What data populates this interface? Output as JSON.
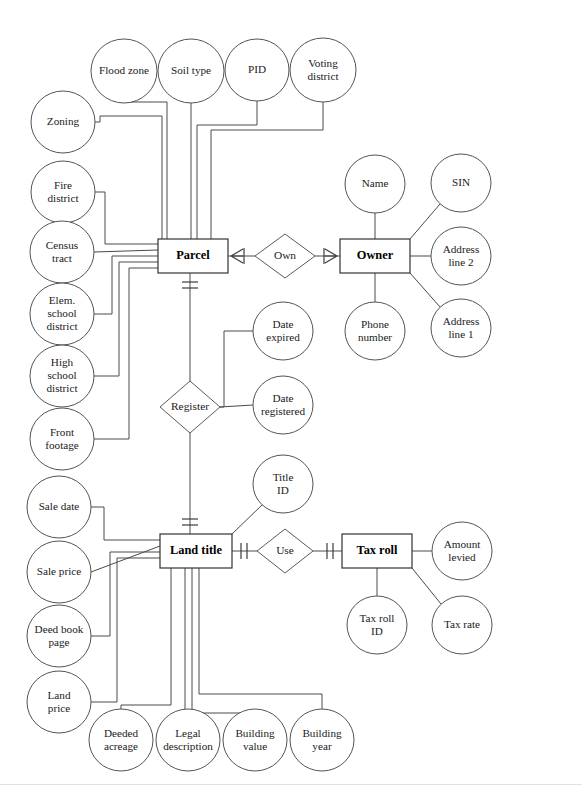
{
  "diagram": {
    "type": "entity-relationship-diagram",
    "notation": "crows-foot",
    "width": 582,
    "height": 803,
    "background_color": "#ffffff",
    "line_color": "#4a4a4a",
    "entities": [
      {
        "id": "parcel",
        "label": "Parcel",
        "x": 193,
        "y": 256,
        "w": 70,
        "h": 34
      },
      {
        "id": "owner",
        "label": "Owner",
        "x": 375,
        "y": 256,
        "w": 70,
        "h": 34
      },
      {
        "id": "land_title",
        "label": "Land title",
        "x": 196,
        "y": 551,
        "w": 72,
        "h": 34
      },
      {
        "id": "tax_roll",
        "label": "Tax roll",
        "x": 377,
        "y": 551,
        "w": 70,
        "h": 34
      }
    ],
    "relationships": [
      {
        "id": "own",
        "label": "Own",
        "x": 285,
        "y": 256,
        "rx": 30,
        "ry": 22,
        "from": "parcel",
        "to": "owner",
        "from_cardinality": "one-or-many",
        "to_cardinality": "one-or-many"
      },
      {
        "id": "register",
        "label": "Register",
        "x": 190,
        "y": 407,
        "rx": 30,
        "ry": 26,
        "from": "parcel",
        "to": "land_title",
        "from_cardinality": "one-and-only-one",
        "to_cardinality": "one-and-only-one"
      },
      {
        "id": "use",
        "label": "Use",
        "x": 285,
        "y": 551,
        "rx": 28,
        "ry": 22,
        "from": "land_title",
        "to": "tax_roll",
        "from_cardinality": "one-and-only-one",
        "to_cardinality": "one-and-only-one"
      }
    ],
    "attributes": [
      {
        "id": "flood_zone",
        "label": "Flood zone",
        "lines": [
          "Flood zone"
        ],
        "cx": 124,
        "cy": 71,
        "rx": 33,
        "ry": 32,
        "owner": "parcel"
      },
      {
        "id": "soil_type",
        "label": "Soil type",
        "lines": [
          "Soil type"
        ],
        "cx": 191,
        "cy": 71,
        "rx": 33,
        "ry": 32,
        "owner": "parcel"
      },
      {
        "id": "pid",
        "label": "PID",
        "lines": [
          "PID"
        ],
        "cx": 257,
        "cy": 70,
        "rx": 32,
        "ry": 31,
        "owner": "parcel"
      },
      {
        "id": "voting_district",
        "label": "Voting district",
        "lines": [
          "Voting",
          "district"
        ],
        "cx": 323,
        "cy": 70,
        "rx": 33,
        "ry": 32,
        "owner": "parcel"
      },
      {
        "id": "zoning",
        "label": "Zoning",
        "lines": [
          "Zoning"
        ],
        "cx": 63,
        "cy": 122,
        "rx": 32,
        "ry": 31,
        "owner": "parcel"
      },
      {
        "id": "fire_district",
        "label": "Fire district",
        "lines": [
          "Fire",
          "district"
        ],
        "cx": 63,
        "cy": 192,
        "rx": 32,
        "ry": 31,
        "owner": "parcel"
      },
      {
        "id": "census_tract",
        "label": "Census tract",
        "lines": [
          "Census",
          "tract"
        ],
        "cx": 62,
        "cy": 252,
        "rx": 32,
        "ry": 31,
        "owner": "parcel"
      },
      {
        "id": "elem_school",
        "label": "Elem. school district",
        "lines": [
          "Elem.",
          "school",
          "district"
        ],
        "cx": 62,
        "cy": 314,
        "rx": 32,
        "ry": 31,
        "owner": "parcel"
      },
      {
        "id": "high_school",
        "label": "High school district",
        "lines": [
          "High",
          "school",
          "district"
        ],
        "cx": 62,
        "cy": 376,
        "rx": 32,
        "ry": 31,
        "owner": "parcel"
      },
      {
        "id": "front_footage",
        "label": "Front footage",
        "lines": [
          "Front",
          "footage"
        ],
        "cx": 62,
        "cy": 439,
        "rx": 32,
        "ry": 31,
        "owner": "parcel"
      },
      {
        "id": "name",
        "label": "Name",
        "lines": [
          "Name"
        ],
        "cx": 375,
        "cy": 184,
        "rx": 30,
        "ry": 29,
        "owner": "owner"
      },
      {
        "id": "sin",
        "label": "SIN",
        "lines": [
          "SIN"
        ],
        "cx": 461,
        "cy": 183,
        "rx": 30,
        "ry": 29,
        "owner": "owner"
      },
      {
        "id": "address_line_2",
        "label": "Address line 2",
        "lines": [
          "Address",
          "line 2"
        ],
        "cx": 461,
        "cy": 256,
        "rx": 30,
        "ry": 29,
        "owner": "owner"
      },
      {
        "id": "address_line_1",
        "label": "Address line 1",
        "lines": [
          "Address",
          "line 1"
        ],
        "cx": 461,
        "cy": 328,
        "rx": 30,
        "ry": 29,
        "owner": "owner"
      },
      {
        "id": "phone_number",
        "label": "Phone number",
        "lines": [
          "Phone",
          "number"
        ],
        "cx": 375,
        "cy": 331,
        "rx": 30,
        "ry": 29,
        "owner": "owner"
      },
      {
        "id": "date_expired",
        "label": "Date expired",
        "lines": [
          "Date",
          "expired"
        ],
        "cx": 283,
        "cy": 331,
        "rx": 30,
        "ry": 29,
        "owner": "register"
      },
      {
        "id": "date_registered",
        "label": "Date registered",
        "lines": [
          "Date",
          "registered"
        ],
        "cx": 283,
        "cy": 405,
        "rx": 30,
        "ry": 29,
        "owner": "register"
      },
      {
        "id": "title_id",
        "label": "Title ID",
        "lines": [
          "Title",
          "ID"
        ],
        "cx": 283,
        "cy": 484,
        "rx": 30,
        "ry": 29,
        "owner": "land_title"
      },
      {
        "id": "sale_date",
        "label": "Sale date",
        "lines": [
          "Sale date"
        ],
        "cx": 59,
        "cy": 507,
        "rx": 32,
        "ry": 31,
        "owner": "land_title"
      },
      {
        "id": "sale_price",
        "label": "Sale price",
        "lines": [
          "Sale price"
        ],
        "cx": 59,
        "cy": 572,
        "rx": 32,
        "ry": 31,
        "owner": "land_title"
      },
      {
        "id": "deed_book_page",
        "label": "Deed book page",
        "lines": [
          "Deed book",
          "page"
        ],
        "cx": 59,
        "cy": 636,
        "rx": 32,
        "ry": 31,
        "owner": "land_title"
      },
      {
        "id": "land_price",
        "label": "Land price",
        "lines": [
          "Land",
          "price"
        ],
        "cx": 59,
        "cy": 702,
        "rx": 32,
        "ry": 31,
        "owner": "land_title"
      },
      {
        "id": "deeded_acreage",
        "label": "Deeded acreage",
        "lines": [
          "Deeded",
          "acreage"
        ],
        "cx": 121,
        "cy": 740,
        "rx": 32,
        "ry": 31,
        "owner": "land_title"
      },
      {
        "id": "legal_description",
        "label": "Legal description",
        "lines": [
          "Legal",
          "description"
        ],
        "cx": 188,
        "cy": 740,
        "rx": 32,
        "ry": 31,
        "owner": "land_title"
      },
      {
        "id": "building_value",
        "label": "Building value",
        "lines": [
          "Building",
          "value"
        ],
        "cx": 255,
        "cy": 740,
        "rx": 32,
        "ry": 31,
        "owner": "land_title"
      },
      {
        "id": "building_year",
        "label": "Building year",
        "lines": [
          "Building",
          "year"
        ],
        "cx": 322,
        "cy": 740,
        "rx": 32,
        "ry": 31,
        "owner": "land_title"
      },
      {
        "id": "amount_levied",
        "label": "Amount levied",
        "lines": [
          "Amount",
          "levied"
        ],
        "cx": 462,
        "cy": 551,
        "rx": 30,
        "ry": 29,
        "owner": "tax_roll"
      },
      {
        "id": "tax_roll_id",
        "label": "Tax roll ID",
        "lines": [
          "Tax roll",
          "ID"
        ],
        "cx": 377,
        "cy": 625,
        "rx": 30,
        "ry": 29,
        "owner": "tax_roll"
      },
      {
        "id": "tax_rate",
        "label": "Tax rate",
        "lines": [
          "Tax rate"
        ],
        "cx": 462,
        "cy": 625,
        "rx": 30,
        "ry": 29,
        "owner": "tax_roll"
      }
    ]
  }
}
